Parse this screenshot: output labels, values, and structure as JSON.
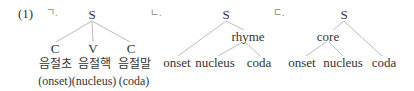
{
  "example_number": "(1)",
  "trees": [
    {
      "marker": "ㄱ.",
      "root": "S",
      "children": [
        {
          "label": "C",
          "korean": "음절초",
          "gloss": "(onset)"
        },
        {
          "label": "V",
          "korean": "음절핵",
          "gloss": "(nucleus)"
        },
        {
          "label": "C",
          "korean": "음절말",
          "gloss": "(coda)"
        }
      ]
    },
    {
      "marker": "ㄴ.",
      "root": "S",
      "intermediate": "rhyme",
      "leaves": [
        "onset",
        "nucleus",
        "coda"
      ]
    },
    {
      "marker": "ㄷ.",
      "root": "S",
      "intermediate": "core",
      "leaves": [
        "onset",
        "nucleus",
        "coda"
      ]
    }
  ],
  "colors": {
    "line": "#aaaaaa",
    "text": "#333333"
  }
}
